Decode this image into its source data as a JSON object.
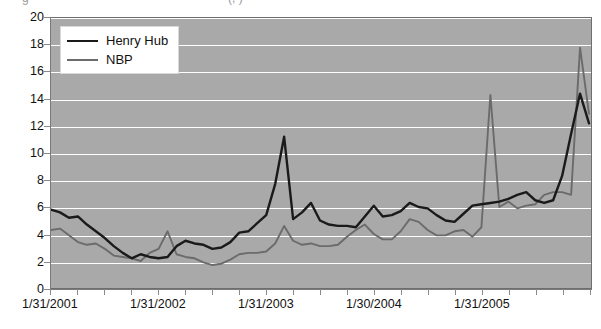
{
  "title_fragment": {
    "left": "g",
    "right": "(,  )"
  },
  "legend": {
    "position": "top-left",
    "items": [
      {
        "label": "Henry Hub",
        "color": "#1a1a1a",
        "width": 2.6
      },
      {
        "label": "NBP",
        "color": "#6b6b6b",
        "width": 2.0
      }
    ]
  },
  "axes": {
    "y_ticks": [
      "0",
      "2",
      "4",
      "6",
      "8",
      "10",
      "12",
      "14",
      "16",
      "18",
      "20"
    ],
    "x_ticks": [
      "1/31/2001",
      "1/31/2002",
      "1/31/2003",
      "1/30/2004",
      "1/31/2005"
    ]
  },
  "chart_data": {
    "type": "line",
    "title": "",
    "xlabel": "",
    "ylabel": "",
    "ylim": [
      0,
      20
    ],
    "ytick_step": 2,
    "grid": true,
    "grid_color": "#ffffff",
    "plot_background": "#a9a9a9",
    "legend_position": "top-left",
    "x_tick_labels": [
      "1/31/2001",
      "1/31/2002",
      "1/31/2003",
      "1/30/2004",
      "1/31/2005"
    ],
    "x_tick_indices": [
      0,
      12,
      24,
      36,
      48
    ],
    "x_minor_tick_interval_months": 3,
    "x_count": 61,
    "x_start": "1/31/2001",
    "x_frequency": "monthly",
    "series": [
      {
        "name": "Henry Hub",
        "color": "#1a1a1a",
        "values": [
          5.8,
          5.6,
          5.2,
          5.3,
          4.7,
          4.2,
          3.7,
          3.1,
          2.6,
          2.2,
          2.5,
          2.3,
          2.2,
          2.3,
          3.1,
          3.5,
          3.3,
          3.2,
          2.9,
          3.0,
          3.4,
          4.1,
          4.2,
          4.8,
          5.4,
          7.7,
          11.2,
          5.1,
          5.6,
          6.3,
          5.0,
          4.7,
          4.6,
          4.6,
          4.5,
          5.3,
          6.1,
          5.3,
          5.4,
          5.7,
          6.3,
          6.0,
          5.9,
          5.4,
          5.0,
          4.9,
          5.5,
          6.1,
          6.2,
          6.3,
          6.4,
          6.6,
          6.9,
          7.1,
          6.5,
          6.3,
          6.5,
          8.3,
          11.4,
          14.4,
          12.2
        ]
      },
      {
        "name": "NBP",
        "color": "#6b6b6b",
        "values": [
          4.3,
          4.4,
          3.9,
          3.4,
          3.2,
          3.3,
          2.9,
          2.4,
          2.3,
          2.2,
          2.0,
          2.6,
          2.9,
          4.2,
          2.5,
          2.3,
          2.2,
          1.9,
          1.7,
          1.8,
          2.1,
          2.5,
          2.6,
          2.6,
          2.7,
          3.3,
          4.6,
          3.5,
          3.2,
          3.3,
          3.1,
          3.1,
          3.2,
          3.8,
          4.3,
          4.7,
          4.0,
          3.6,
          3.6,
          4.2,
          5.1,
          4.9,
          4.3,
          3.9,
          3.9,
          4.2,
          4.3,
          3.8,
          4.5,
          14.3,
          6.0,
          6.4,
          5.9,
          6.1,
          6.2,
          6.9,
          7.1,
          7.1,
          6.9,
          17.8,
          12.9
        ]
      }
    ]
  }
}
